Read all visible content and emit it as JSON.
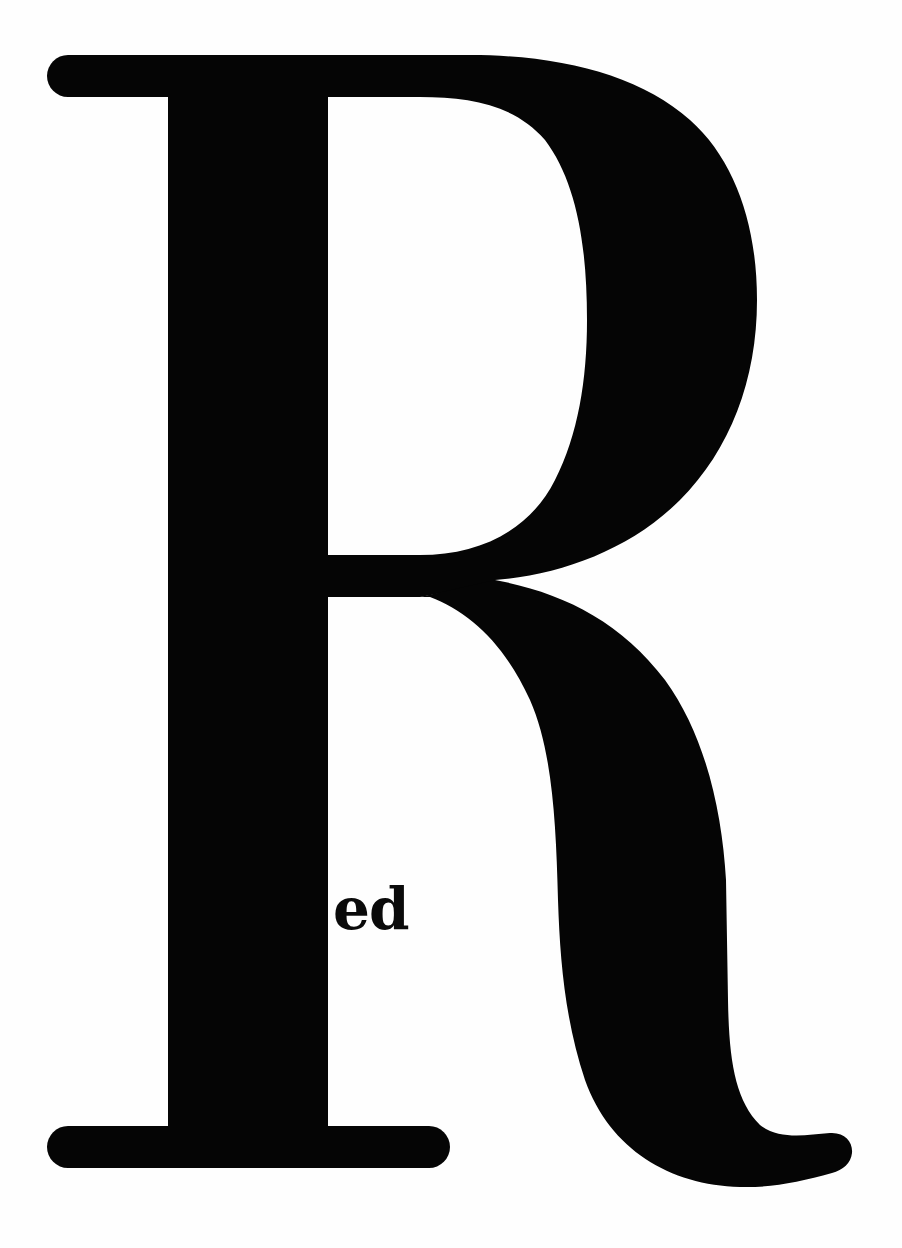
{
  "poster": {
    "big_letter": "R",
    "caption": "ed",
    "full_word": "Red",
    "colors": {
      "background": "#fefefe",
      "ink": "#050505"
    }
  }
}
